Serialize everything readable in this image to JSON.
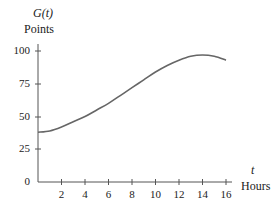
{
  "chart_data": {
    "type": "line",
    "title": "",
    "ylabel_function": "G(t)",
    "ylabel": "Points",
    "xlabel_var": "t",
    "xlabel": "Hours",
    "xlim": [
      0,
      16
    ],
    "ylim": [
      0,
      100
    ],
    "x_ticks": [
      2,
      4,
      6,
      8,
      10,
      12,
      14,
      16
    ],
    "y_ticks": [
      0,
      25,
      50,
      75,
      100
    ],
    "grid": false,
    "legend": null,
    "series": [
      {
        "name": "G(t)",
        "x": [
          0,
          1,
          2,
          3,
          4,
          5,
          6,
          7,
          8,
          9,
          10,
          11,
          12,
          13,
          14,
          15,
          16
        ],
        "values": [
          38,
          39,
          42,
          46,
          50,
          55,
          60,
          66,
          72,
          78,
          84,
          89,
          93,
          96,
          97,
          96,
          93
        ]
      }
    ]
  },
  "labels": {
    "y_func": "G(t)",
    "y_unit": "Points",
    "x_var": "t",
    "x_unit": "Hours"
  },
  "ticks": {
    "y": [
      "100",
      "75",
      "50",
      "25",
      "0"
    ],
    "x": [
      "2",
      "4",
      "6",
      "8",
      "10",
      "12",
      "14",
      "16"
    ]
  }
}
